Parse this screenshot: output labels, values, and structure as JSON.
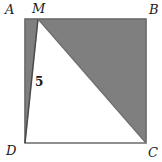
{
  "figure": {
    "kind": "plane-geometry-diagram",
    "shape": "square-with-shaded-triangle",
    "colors": {
      "background": "#ffffff",
      "shading": "#7f7f7f",
      "stroke": "#6b6b6b",
      "label": "#1a1a1a"
    },
    "square": {
      "name": "ABCD",
      "left": 25,
      "top": 19,
      "right": 146,
      "bottom": 143
    },
    "vertices": [
      {
        "id": "A",
        "label": "A",
        "x": 25,
        "y": 19,
        "label_x": 5,
        "label_y": 3
      },
      {
        "id": "M",
        "label": "M",
        "x": 38,
        "y": 19,
        "label_x": 32,
        "label_y": 2
      },
      {
        "id": "B",
        "label": "B",
        "x": 146,
        "y": 19,
        "label_x": 149,
        "label_y": 3
      },
      {
        "id": "C",
        "label": "C",
        "x": 146,
        "y": 143,
        "label_x": 148,
        "label_y": 146
      },
      {
        "id": "D",
        "label": "D",
        "x": 25,
        "y": 143,
        "label_x": 6,
        "label_y": 144
      }
    ],
    "segment_labels": [
      {
        "id": "MD",
        "label": "5",
        "label_x": 35,
        "label_y": 76
      }
    ],
    "shaded_regions": [
      {
        "id": "triangle-MBC",
        "points": "38,19 146,19 146,143"
      },
      {
        "id": "strip-AMD",
        "points": "25,19 38,19 25,143"
      }
    ],
    "outline": {
      "id": "square-outline",
      "points": "25,19 146,19 146,143 25,143"
    },
    "inner_segments": [
      {
        "id": "segment-MD",
        "x1": 38,
        "y1": 19,
        "x2": 25,
        "y2": 143
      },
      {
        "id": "segment-MC",
        "x1": 38,
        "y1": 19,
        "x2": 146,
        "y2": 143
      }
    ]
  }
}
